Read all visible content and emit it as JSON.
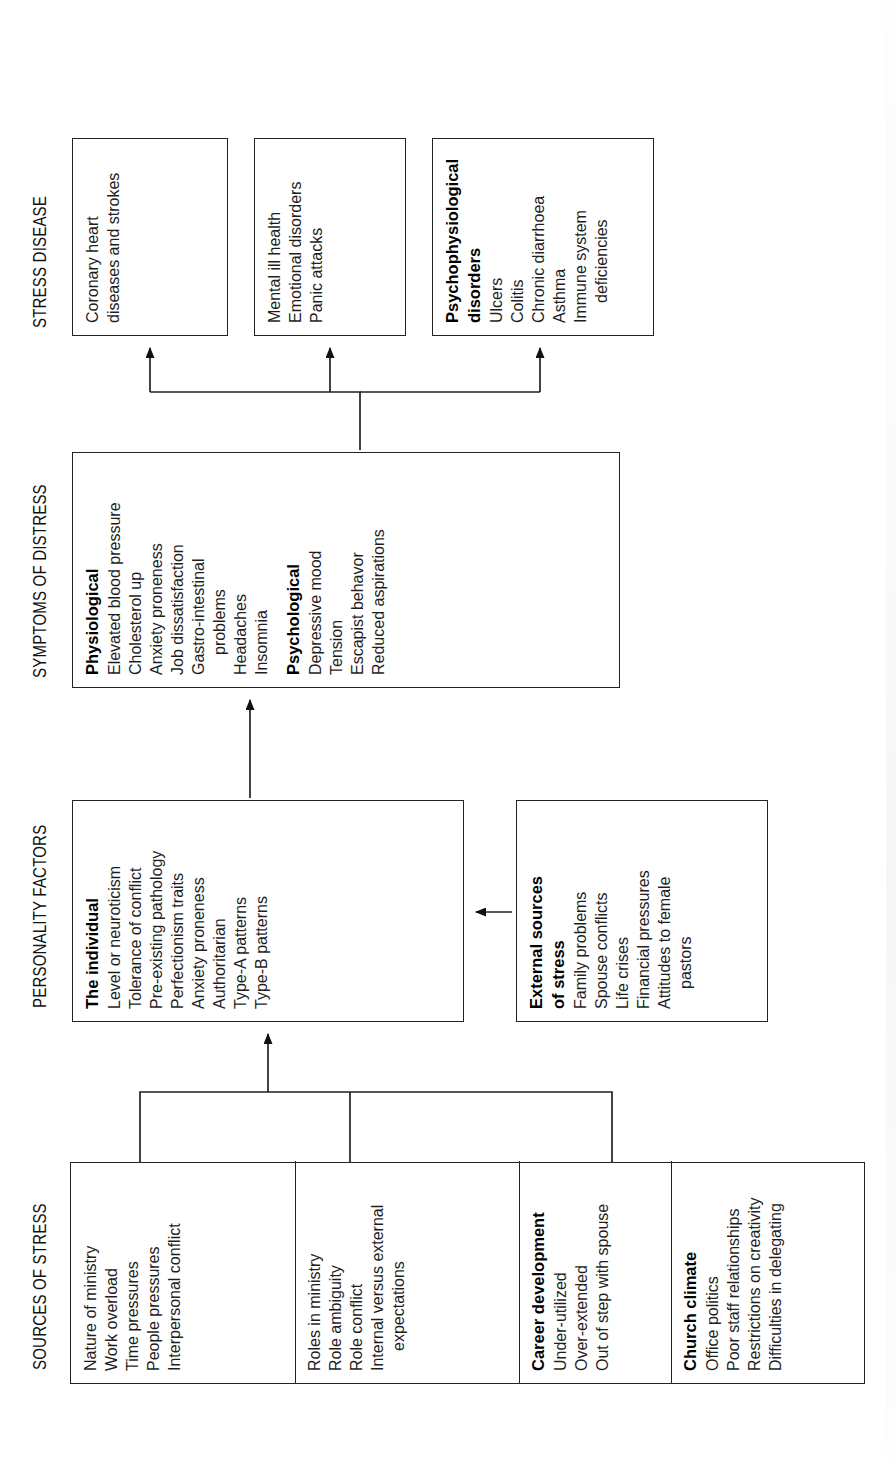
{
  "headings": {
    "sources": "SOURCES OF STRESS",
    "personality": "PERSONALITY FACTORS",
    "symptoms": "SYMPTOMS OF DISTRESS",
    "disease": "STRESS DISEASE"
  },
  "sources_of_stress": {
    "groups": [
      {
        "title": "",
        "items": [
          "Nature of ministry",
          "Work overload",
          "Time pressures",
          "People pressures",
          "Interpersonal conflict"
        ]
      },
      {
        "title": "",
        "items": [
          "Roles in ministry",
          "Role ambiguity",
          "Role conflict",
          "Internal versus external",
          "expectations"
        ]
      },
      {
        "title": "Career development",
        "items": [
          "Under-utilized",
          "Over-extended",
          "Out of step with spouse"
        ]
      },
      {
        "title": "Church climate",
        "items": [
          "Office politics",
          "Poor staff relationships",
          "Restrictions on creativity",
          "Difficulties in delegating"
        ]
      }
    ]
  },
  "personality_factors": {
    "individual": {
      "title": "The individual",
      "items": [
        "Level or neuroticism",
        "Tolerance of conflict",
        "Pre-existing pathology",
        "Perfectionism traits",
        "Anxiety proneness",
        "Authoritarian",
        "Type-A patterns",
        "Type-B patterns"
      ]
    },
    "external": {
      "title": "External sources of stress",
      "title_line1": "External sources",
      "title_line2": "of stress",
      "items": [
        "Family problems",
        "Spouse conflicts",
        "Life crises",
        "Financial pressures",
        "Attitudes to female",
        "pastors"
      ]
    }
  },
  "symptoms_of_distress": {
    "physiological": {
      "title": "Physiological",
      "items": [
        "Elevated blood pressure",
        "Cholesterol up",
        "Anxiety proneness",
        "Job dissatisfaction",
        "Gastro-intestinal",
        "problems",
        "Headaches",
        "Insomnia"
      ]
    },
    "psychological": {
      "title": "Psychological",
      "items": [
        "Depressive mood",
        "Tension",
        "Escapist behavor",
        "Reduced aspirations"
      ]
    }
  },
  "stress_disease": {
    "coronary": {
      "title": "",
      "items": [
        "Coronary heart",
        "diseases and strokes"
      ]
    },
    "mental": {
      "title": "",
      "items": [
        "Mental ill health",
        "Emotional disorders",
        "Panic attacks"
      ]
    },
    "psychophysiological": {
      "title": "Psychophysiological disorders",
      "title_line1": "Psychophysiological",
      "title_line2": "disorders",
      "items": [
        "Ulcers",
        "Colitis",
        "Chronic diarrhoea",
        "Asthma",
        "Immune system",
        "deficiencies"
      ]
    }
  },
  "colors": {
    "stroke": "#222222",
    "text": "#1e1e1e",
    "background": "#ffffff"
  }
}
